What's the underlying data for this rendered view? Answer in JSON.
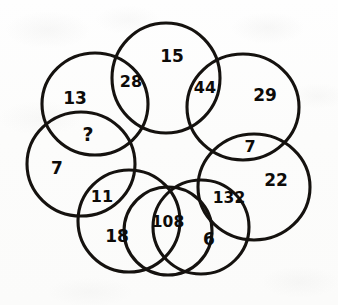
{
  "diagram": {
    "shape_count": 8,
    "stroke_color": "#15120f",
    "text_color": "#0d0b09",
    "background_color": "#fdfdfc",
    "unknown_marker": "?"
  },
  "circles": [
    {
      "id": "top",
      "label": "top-circle",
      "value": "15",
      "cx": 166,
      "cy": 78,
      "rx": 54,
      "ry": 54,
      "value_x": 172,
      "value_y": 56
    },
    {
      "id": "upper-right",
      "label": "upper-right-circle",
      "value": "29",
      "cx": 243,
      "cy": 106,
      "rx": 54,
      "ry": 54,
      "value_x": 265,
      "value_y": 95
    },
    {
      "id": "right",
      "label": "right-circle",
      "value": "22",
      "cx": 254,
      "cy": 186,
      "rx": 54,
      "ry": 54,
      "value_x": 276,
      "value_y": 180
    },
    {
      "id": "lower-right",
      "label": "lower-right-circle",
      "value": "6",
      "cx": 200,
      "cy": 228,
      "rx": 47,
      "ry": 47,
      "value_x": 209,
      "value_y": 239
    },
    {
      "id": "lower-left",
      "label": "lower-left-circle",
      "value": "18",
      "cx": 129,
      "cy": 222,
      "rx": 50,
      "ry": 50,
      "value_x": 117,
      "value_y": 236
    },
    {
      "id": "left",
      "label": "left-circle",
      "value": "7",
      "cx": 80,
      "cy": 165,
      "rx": 52,
      "ry": 52,
      "value_x": 57,
      "value_y": 168
    },
    {
      "id": "upper-left",
      "label": "upper-left-circle",
      "value": "13",
      "cx": 94,
      "cy": 104,
      "rx": 51,
      "ry": 51,
      "value_x": 75,
      "value_y": 98
    },
    {
      "id": "inner-bottom",
      "label": "bottom-center-circle",
      "value": "",
      "cx": 168,
      "cy": 232,
      "rx": 44,
      "ry": 44,
      "value_x": 0,
      "value_y": 0
    }
  ],
  "overlaps": [
    {
      "id": "ov-28",
      "label": "overlap-top-upperleft",
      "value": "28",
      "x": 131,
      "y": 81,
      "size": "normal"
    },
    {
      "id": "ov-44",
      "label": "overlap-top-upperright",
      "value": "44",
      "x": 205,
      "y": 87,
      "size": "normal"
    },
    {
      "id": "ov-7b",
      "label": "overlap-upperright-right",
      "value": "7",
      "x": 250,
      "y": 146,
      "size": "normal"
    },
    {
      "id": "ov-132",
      "label": "overlap-right-lowerright",
      "value": "132",
      "x": 229,
      "y": 198,
      "size": "wide"
    },
    {
      "id": "ov-108",
      "label": "overlap-lowerright-center",
      "value": "108",
      "x": 168,
      "y": 222,
      "size": "wide"
    },
    {
      "id": "ov-11",
      "label": "overlap-lowerleft-left",
      "value": "11",
      "x": 102,
      "y": 196,
      "size": "normal"
    },
    {
      "id": "ov-q",
      "label": "overlap-upperleft-left",
      "value": "?",
      "x": 88,
      "y": 134,
      "size": "unknown"
    }
  ],
  "values_summary": {
    "outer_values": [
      "15",
      "29",
      "22",
      "6",
      "18",
      "7",
      "13"
    ],
    "overlap_values": [
      "28",
      "44",
      "7",
      "132",
      "108",
      "11",
      "?"
    ]
  }
}
